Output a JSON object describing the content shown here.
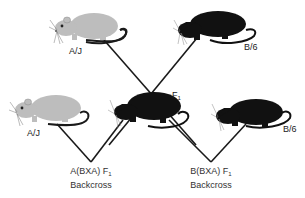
{
  "diagram": {
    "type": "mouse backcross breeding scheme",
    "colors": {
      "aj_strain": "#bdbdbd",
      "b6_strain": "#111111",
      "lines": "#1a1a1a",
      "background": "#ffffff"
    },
    "parents": {
      "aj": {
        "label": "A/J",
        "coat": "light gray"
      },
      "b6": {
        "label": "B/6",
        "coat": "black"
      }
    },
    "f1": {
      "label": "F",
      "subscript": "1",
      "coat": "black"
    },
    "backcross_parents": {
      "aj": {
        "label": "A/J"
      },
      "b6": {
        "label": "B/6"
      }
    },
    "crosses": [
      {
        "line1": "A(BXA) F",
        "subscript": "1",
        "line2": "Backcross"
      },
      {
        "line1": "B(BXA) F",
        "subscript": "1",
        "line2": "Backcross"
      }
    ]
  }
}
